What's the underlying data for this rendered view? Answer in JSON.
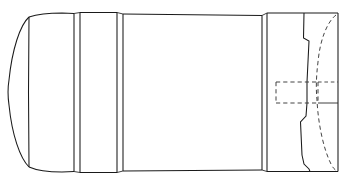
{
  "drawing": {
    "title": "Cylindrical Vessel Side Elevation",
    "type": "engineering-line-drawing",
    "view": "side elevation / longitudinal section",
    "orientation": "horizontal axis",
    "canvas": {
      "width": 342,
      "height": 184,
      "background": "#ffffff"
    },
    "line_styles": {
      "visible_edge": {
        "color": "#1a1a1a",
        "width": 1.05,
        "pattern": "solid"
      },
      "secondary_edge": {
        "color": "#2b2b2b",
        "width": 0.9,
        "pattern": "solid"
      },
      "hidden_edge": {
        "color": "#3a3a3a",
        "width": 0.95,
        "pattern": "dashed"
      }
    },
    "axis": {
      "centerline_y": 92
    },
    "extents": {
      "left_x": 8,
      "right_x": 338,
      "top_y": 14,
      "bottom_y": 172
    },
    "components": [
      {
        "id": "nose-dome",
        "label": "Rounded nose dome (left end closure)",
        "kind": "curved-end-cap",
        "x_start": 8,
        "x_end": 28,
        "description": "Elliptical dome curve bulging left, apex at mid height"
      },
      {
        "id": "nose-joint-line",
        "label": "Dome-to-shell weld seam",
        "kind": "vertical-seam",
        "x": 28
      },
      {
        "id": "forward-shell",
        "label": "Forward shell course",
        "kind": "cylindrical-course",
        "x_start": 28,
        "x_end": 74
      },
      {
        "id": "ring-band-forward",
        "label": "Forward reinforcing ring band",
        "kind": "ring-band",
        "x_start": 74,
        "x_end": 80
      },
      {
        "id": "band-course",
        "label": "Band course between rings",
        "kind": "cylindrical-course",
        "x_start": 80,
        "x_end": 117
      },
      {
        "id": "ring-band-mid",
        "label": "Mid reinforcing ring band",
        "kind": "ring-band",
        "x_start": 117,
        "x_end": 123
      },
      {
        "id": "main-barrel",
        "label": "Main barrel / central cylindrical body",
        "kind": "cylindrical-course",
        "x_start": 123,
        "x_end": 262
      },
      {
        "id": "ring-band-aft",
        "label": "Aft reinforcing ring band",
        "kind": "ring-band",
        "x_start": 262,
        "x_end": 268
      },
      {
        "id": "aft-section",
        "label": "Aft stepped closure section",
        "kind": "stepped-end",
        "x_start": 268,
        "x_end": 338,
        "description": "Stepped solid profile with two shoulder offsets"
      },
      {
        "id": "aft-step-upper",
        "label": "Upper step shoulder",
        "kind": "step-shoulder",
        "y": 40
      },
      {
        "id": "aft-step-lower",
        "label": "Lower step shoulder",
        "kind": "step-shoulder",
        "y": 120
      },
      {
        "id": "internal-bulkhead",
        "label": "Internal domed bulkhead (hidden)",
        "kind": "hidden-curve",
        "x_start": 305,
        "x_end": 332,
        "description": "Dashed curved hidden outline of internal dome"
      },
      {
        "id": "internal-port-rect",
        "label": "Internal port / cavity outline (hidden)",
        "kind": "hidden-rectangle",
        "x_start": 275,
        "x_end": 318,
        "y_start": 82,
        "y_end": 103
      },
      {
        "id": "axis-stub-upper",
        "label": "Upper hidden shelf line",
        "kind": "hidden-horizontal",
        "y": 82
      },
      {
        "id": "axis-stub-lower",
        "label": "Lower hidden shelf line",
        "kind": "hidden-horizontal",
        "y": 103
      }
    ]
  }
}
